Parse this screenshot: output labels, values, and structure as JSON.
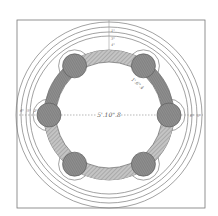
{
  "diagram": {
    "type": "technical-drawing",
    "colors": {
      "background": "#ffffff",
      "line": "#6a6a6a",
      "hatch_fill": "#b8b8b8",
      "boss_fill": "#8c8c8c",
      "dark_annulus": "#9a9a9a"
    },
    "frame": {
      "x": 17,
      "y": 20,
      "width": 188,
      "height": 188
    },
    "center": {
      "x": 109,
      "y": 115
    },
    "outer_circles_r": [
      93,
      88,
      83,
      79
    ],
    "annulus": {
      "outer_r": 65,
      "inner_r": 53
    },
    "bosses": {
      "count": 6,
      "ring_r": 60,
      "boss_r": 12,
      "clearance_r": 16,
      "angles_deg": [
        0,
        55,
        125,
        180,
        235,
        305
      ]
    },
    "labels": {
      "center_dimension": "5'.10\".8",
      "boss_dimension": "1'.6\".4",
      "top_dimensions": [
        "1\"",
        "3\"",
        "4\""
      ],
      "left_dimensions": [
        "6\"",
        "5\"",
        "2\""
      ],
      "right_dimensions": [
        "6\"",
        "5\""
      ]
    }
  }
}
